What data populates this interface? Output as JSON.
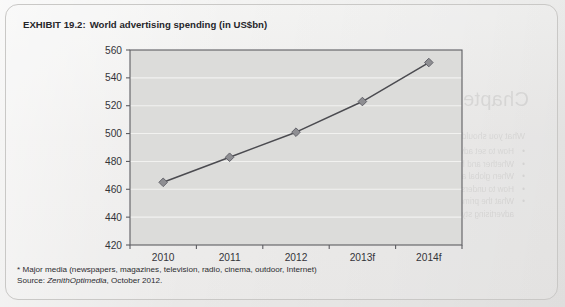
{
  "exhibit": {
    "label": "EXHIBIT 19.2:",
    "caption": "World advertising spending (in US$bn)"
  },
  "chart_data": {
    "type": "line",
    "title": "World advertising spending (in US$bn)",
    "xlabel": "",
    "ylabel": "",
    "categories": [
      "2010",
      "2011",
      "2012",
      "2013f",
      "2014f"
    ],
    "values": [
      465,
      483,
      501,
      523,
      551
    ],
    "ylim": [
      420,
      560
    ],
    "yticks": [
      420,
      440,
      460,
      480,
      500,
      520,
      540,
      560
    ],
    "grid": "horizontal",
    "legend": "none",
    "marker": "diamond",
    "line_color": "#4b4b50",
    "marker_color": "#8e8e92",
    "plot_bg": "#dcdcda",
    "gridline_color": "#f2f2f0"
  },
  "notes": {
    "footnote": "* Major media (newspapers, magazines, television, radio, cinema, outdoor, Internet)",
    "source_label": "Source: ",
    "source_name": "ZenithOptimedia",
    "source_rest": ", October 2012."
  },
  "showthrough": {
    "title": "Chapter Learning Objectives",
    "lead": "What you should learn from Chapter 19",
    "items": [
      "How to set advertising objectives and budgets for the different types of products",
      "Whether and how advertising is effective",
      "When global advertising is most effective and when localized advertising is better",
      "How to understand whether a single European market or an advertising",
      "What the primary differences are between European and American",
      "advertising styles and approaches"
    ]
  }
}
